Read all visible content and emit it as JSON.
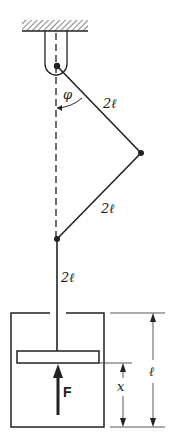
{
  "diagram": {
    "labels": {
      "angle": "φ",
      "upper_link": "2ℓ",
      "middle_link": "2ℓ",
      "rod": "2ℓ",
      "force": "F",
      "cylinder_height": "ℓ",
      "piston_position": "x"
    },
    "colors": {
      "line": "#222222",
      "background": "#ffffff"
    }
  }
}
